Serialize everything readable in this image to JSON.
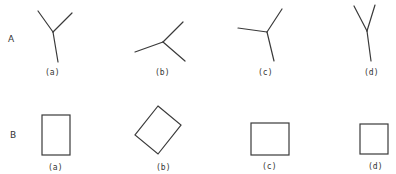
{
  "rows": [
    {
      "label": "A",
      "kind": "three-line junctions",
      "figures": [
        {
          "label": "(a)",
          "center": [
            53,
            32
          ],
          "ends": [
            [
              38,
              11
            ],
            [
              72,
              13
            ],
            [
              58,
              62
            ]
          ]
        },
        {
          "label": "(b)",
          "center": [
            163,
            42
          ],
          "ends": [
            [
              135,
              52
            ],
            [
              183,
              22
            ],
            [
              185,
              61
            ]
          ]
        },
        {
          "label": "(c)",
          "center": [
            267,
            32
          ],
          "ends": [
            [
              238,
              28
            ],
            [
              282,
              9
            ],
            [
              274,
              61
            ]
          ]
        },
        {
          "label": "(d)",
          "center": [
            367,
            31
          ],
          "ends": [
            [
              354,
              6
            ],
            [
              375,
              5
            ],
            [
              371,
              61
            ]
          ]
        }
      ]
    },
    {
      "label": "B",
      "kind": "quadrilaterals",
      "figures": [
        {
          "label": "(a)",
          "shape": "tall rectangle"
        },
        {
          "label": "(b)",
          "shape": "rotated rectangle"
        },
        {
          "label": "(c)",
          "shape": "wide rectangle"
        },
        {
          "label": "(d)",
          "shape": "square"
        }
      ]
    }
  ]
}
